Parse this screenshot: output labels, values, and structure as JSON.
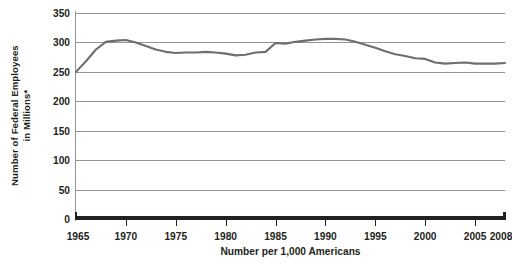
{
  "chart_data": {
    "type": "line",
    "title": "",
    "subtitle": "",
    "xlabel": "Number per 1,000 Americans",
    "ylabel": "Number of Federal Employees in Millions*",
    "ylabel_line1": "Number of Federal Employees",
    "ylabel_line2": "in Millions*",
    "grid": true,
    "legend": "none",
    "line_color": "#6d6e71",
    "grid_color": "#939598",
    "axis_color": "#231f20",
    "background": "#ffffff",
    "xlim": [
      1965,
      2008
    ],
    "ylim": [
      0,
      350
    ],
    "yticks": [
      0,
      50,
      100,
      150,
      200,
      250,
      300,
      350
    ],
    "ytick_labels": [
      "0",
      "50",
      "100",
      "150",
      "200",
      "250",
      "300",
      "350"
    ],
    "xticks": [
      1965,
      1970,
      1975,
      1980,
      1985,
      1990,
      1995,
      2000,
      2005,
      2008
    ],
    "xtick_labels": [
      "1965",
      "1970",
      "1975",
      "1980",
      "1985",
      "1990",
      "1995",
      "2000",
      "2005",
      "2008"
    ],
    "series": [
      {
        "name": "Federal employees per 1,000 Americans",
        "x": [
          1965,
          1966,
          1967,
          1968,
          1969,
          1970,
          1971,
          1972,
          1973,
          1974,
          1975,
          1976,
          1977,
          1978,
          1979,
          1980,
          1981,
          1982,
          1983,
          1984,
          1985,
          1986,
          1987,
          1988,
          1989,
          1990,
          1991,
          1992,
          1993,
          1994,
          1995,
          1996,
          1997,
          1998,
          1999,
          2000,
          2001,
          2002,
          2003,
          2004,
          2005,
          2006,
          2007,
          2008
        ],
        "values": [
          250,
          268,
          288,
          301,
          303,
          304,
          300,
          294,
          288,
          284,
          282,
          283,
          283,
          284,
          283,
          281,
          278,
          279,
          283,
          284,
          299,
          298,
          301,
          303,
          305,
          306,
          306,
          305,
          301,
          296,
          291,
          285,
          280,
          277,
          273,
          272,
          266,
          264,
          265,
          266,
          264,
          264,
          264,
          265
        ]
      }
    ]
  }
}
